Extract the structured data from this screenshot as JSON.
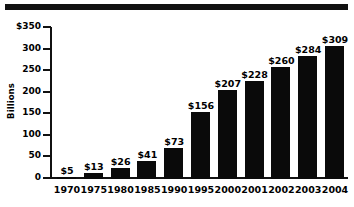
{
  "chart_data": {
    "type": "bar",
    "title": "",
    "xlabel": "",
    "ylabel": "Billions",
    "categories": [
      "1970",
      "1975",
      "1980",
      "1985",
      "1990",
      "1995",
      "2000",
      "2001",
      "2002",
      "2003",
      "2004"
    ],
    "values": [
      5,
      13,
      26,
      41,
      73,
      156,
      207,
      228,
      260,
      284,
      309
    ],
    "value_labels": [
      "$5",
      "$13",
      "$26",
      "$41",
      "$73",
      "$156",
      "$207",
      "$228",
      "$260",
      "$284",
      "$309"
    ],
    "ylim": [
      0,
      350
    ],
    "ytick_values": [
      0,
      50,
      100,
      150,
      200,
      250,
      300,
      350
    ],
    "ytick_labels": [
      "0",
      "50",
      "100",
      "150",
      "200",
      "250",
      "300",
      "$350"
    ],
    "grid": false,
    "legend": null,
    "bar_color": "#0a0a0a",
    "background_color": "#ffffff",
    "axis_color": "#111111"
  },
  "decor": {
    "top_rule_color": "#111111"
  }
}
